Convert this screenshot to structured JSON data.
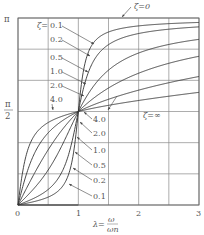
{
  "chart_data": {
    "type": "line",
    "title": "",
    "xlabel": "λ = ω/ωn",
    "xlabel_parts": {
      "lambda": "λ=",
      "num": "ω",
      "den": "ωn"
    },
    "ylabel": "φ",
    "xlim": [
      0,
      3
    ],
    "ylim": [
      0,
      3.14159
    ],
    "x_ticks": [
      {
        "value": 0,
        "label": "0"
      },
      {
        "value": 1,
        "label": "1"
      },
      {
        "value": 2,
        "label": "2"
      },
      {
        "value": 3,
        "label": "3"
      }
    ],
    "y_ticks": [
      {
        "value": 3.14159,
        "label": "π"
      },
      {
        "value": 1.5708,
        "label": "π/2"
      }
    ],
    "grid": {
      "x_step": 0.5,
      "y_divisions": 6
    },
    "formula": "phi = atan2(2*zeta*lambda, 1 - lambda^2)",
    "series": [
      {
        "name": "ζ=0.1",
        "zeta": 0.1
      },
      {
        "name": "ζ=0.2",
        "zeta": 0.2
      },
      {
        "name": "ζ=0.5",
        "zeta": 0.5
      },
      {
        "name": "ζ=1.0",
        "zeta": 1.0
      },
      {
        "name": "ζ=2.0",
        "zeta": 2.0
      },
      {
        "name": "ζ=4.0",
        "zeta": 4.0
      }
    ],
    "special_series": [
      {
        "name": "ζ=0",
        "description": "step from 0 to π at λ=1"
      },
      {
        "name": "ζ=∞",
        "description": "constant φ = π/2"
      }
    ],
    "sample_values": {
      "x": [
        0,
        0.5,
        1,
        1.5,
        2,
        3
      ],
      "ζ=0.1": [
        0,
        0.133,
        1.571,
        2.976,
        3.009,
        3.067
      ],
      "ζ=0.2": [
        0,
        0.261,
        1.571,
        2.815,
        2.88,
        2.998
      ],
      "ζ=0.5": [
        0,
        0.588,
        1.571,
        2.265,
        2.554,
        2.498
      ],
      "ζ=1.0": [
        0,
        0.927,
        1.571,
        1.966,
        2.214,
        2.498
      ],
      "ζ=2.0": [
        0,
        1.212,
        1.571,
        1.766,
        1.928,
        2.159
      ],
      "ζ=4.0": [
        0,
        1.385,
        1.571,
        1.667,
        1.747,
        1.893
      ]
    },
    "annotations": {
      "upper_labels": [
        {
          "text": "ζ=",
          "prefix": true
        },
        {
          "text": "0.1"
        },
        {
          "text": "0.2"
        },
        {
          "text": "0.5"
        },
        {
          "text": "1.0"
        },
        {
          "text": "2.0"
        },
        {
          "text": "4.0"
        }
      ],
      "lower_labels": [
        "4.0",
        "2.0",
        "1.0",
        "0.5",
        "0.2",
        "0.1"
      ],
      "zeta_zero": "ζ=0",
      "zeta_inf": "ζ=∞"
    }
  }
}
